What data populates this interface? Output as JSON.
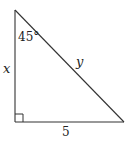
{
  "figure": {
    "type": "right-triangle",
    "stroke_color": "#333333",
    "vertices": {
      "top": [
        15,
        10
      ],
      "bottom_left": [
        15,
        122
      ],
      "bottom_right": [
        124,
        122
      ]
    },
    "right_angle_marker": {
      "corner": "bottom_left",
      "size": 8
    },
    "labels": {
      "angle": "45°",
      "vertical_leg": "x",
      "hypotenuse": "y",
      "base": "5"
    }
  }
}
